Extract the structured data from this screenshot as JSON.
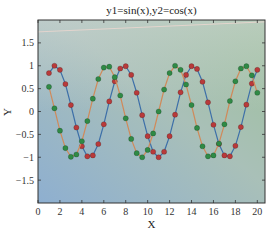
{
  "chart_data": {
    "type": "line",
    "title": "y1=sin(x),y2=cos(x)",
    "xlabel": "X",
    "ylabel": "Y",
    "xlim": [
      0,
      20.7
    ],
    "ylim": [
      -2,
      2
    ],
    "xticks": [
      0,
      2,
      4,
      6,
      8,
      10,
      12,
      14,
      16,
      18,
      20
    ],
    "xtick_labels": [
      "0",
      "2",
      "4",
      "6",
      "8",
      "10",
      "12",
      "14",
      "16",
      "18",
      "20"
    ],
    "yticks": [
      -1.5,
      -1,
      -0.5,
      0,
      0.5,
      1,
      1.5
    ],
    "ytick_labels": [
      "−1.5",
      "−1",
      "−0.5",
      "0",
      "0.5",
      "1",
      "1.5"
    ],
    "grid": false,
    "legend": null,
    "background": {
      "gradient": [
        "#b9c5ca",
        "#8eafd0",
        "#9dc09a"
      ]
    },
    "x": [
      1,
      1.5,
      2,
      2.5,
      3,
      3.5,
      4,
      4.5,
      5,
      5.5,
      6,
      6.5,
      7,
      7.5,
      8,
      8.5,
      9,
      9.5,
      10,
      10.5,
      11,
      11.5,
      12,
      12.5,
      13,
      13.5,
      14,
      14.5,
      15,
      15.5,
      16,
      16.5,
      17,
      17.5,
      18,
      18.5,
      19,
      19.5,
      20
    ],
    "series": [
      {
        "name": "y1=sin(x)",
        "line_color": "#3d6fa8",
        "marker_color": "#b83a3a",
        "values": [
          0.84,
          1.0,
          0.91,
          0.6,
          0.14,
          -0.35,
          -0.76,
          -0.98,
          -0.96,
          -0.71,
          -0.28,
          0.22,
          0.66,
          0.94,
          0.99,
          0.8,
          0.41,
          -0.08,
          -0.54,
          -0.88,
          -1.0,
          -0.88,
          -0.54,
          -0.07,
          0.42,
          0.8,
          0.99,
          0.93,
          0.65,
          0.2,
          -0.29,
          -0.71,
          -0.96,
          -0.98,
          -0.75,
          -0.34,
          0.15,
          0.61,
          0.91
        ]
      },
      {
        "name": "y2=cos(x)",
        "line_color": "#d08a5a",
        "marker_color": "#2f8a45",
        "values": [
          0.54,
          0.07,
          -0.42,
          -0.8,
          -0.99,
          -0.94,
          -0.65,
          -0.21,
          0.28,
          0.71,
          0.96,
          0.98,
          0.75,
          0.35,
          -0.15,
          -0.6,
          -0.91,
          -1.0,
          -0.84,
          -0.48,
          0.0,
          0.48,
          0.84,
          1.0,
          0.91,
          0.59,
          0.14,
          -0.36,
          -0.76,
          -0.98,
          -0.96,
          -0.7,
          -0.28,
          0.23,
          0.66,
          0.94,
          0.99,
          0.79,
          0.41
        ]
      }
    ],
    "annotations": [
      {
        "type": "faint-line",
        "color": "#e8d6cf",
        "from": [
          0,
          1.74
        ],
        "to": [
          20.7,
          1.96
        ]
      }
    ]
  }
}
